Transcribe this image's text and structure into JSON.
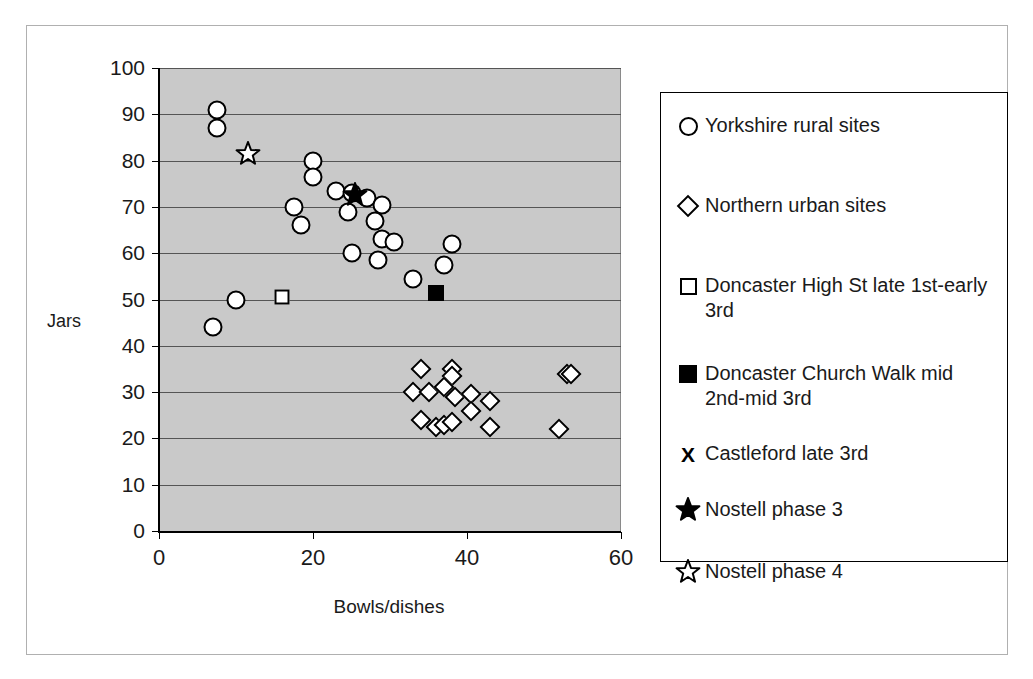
{
  "chart_data": {
    "type": "scatter",
    "title": "",
    "xlabel": "Bowls/dishes",
    "ylabel": "Jars",
    "xlim": [
      0,
      60
    ],
    "ylim": [
      0,
      100
    ],
    "xticks": [
      0,
      20,
      40,
      60
    ],
    "yticks": [
      0,
      10,
      20,
      30,
      40,
      50,
      60,
      70,
      80,
      90,
      100
    ],
    "grid": "horizontal",
    "plot_background": "#c9c9c9",
    "legend_position": "right",
    "series": [
      {
        "name": "Yorkshire rural sites",
        "marker": "open-circle",
        "points": [
          [
            7.5,
            91
          ],
          [
            7.5,
            87
          ],
          [
            20,
            80
          ],
          [
            20,
            76.5
          ],
          [
            17.5,
            70
          ],
          [
            18.5,
            66
          ],
          [
            23,
            73.5
          ],
          [
            25,
            73
          ],
          [
            27,
            72
          ],
          [
            24.5,
            69
          ],
          [
            29,
            70.5
          ],
          [
            28,
            67
          ],
          [
            29,
            63
          ],
          [
            30.5,
            62.5
          ],
          [
            25,
            60
          ],
          [
            28.5,
            58.5
          ],
          [
            33,
            54.5
          ],
          [
            37,
            57.5
          ],
          [
            38,
            62
          ],
          [
            10,
            50
          ],
          [
            7,
            44
          ]
        ]
      },
      {
        "name": "Northern urban sites",
        "marker": "open-diamond",
        "points": [
          [
            34,
            35
          ],
          [
            38,
            35
          ],
          [
            38,
            33.5
          ],
          [
            33,
            30
          ],
          [
            35,
            30
          ],
          [
            37,
            31
          ],
          [
            38.5,
            29
          ],
          [
            40.5,
            29.5
          ],
          [
            40.5,
            26
          ],
          [
            34,
            24
          ],
          [
            36,
            22.5
          ],
          [
            37,
            23
          ],
          [
            38,
            23.5
          ],
          [
            43,
            28
          ],
          [
            43,
            22.5
          ],
          [
            53,
            34
          ],
          [
            53.5,
            34
          ],
          [
            52,
            22
          ]
        ]
      },
      {
        "name": "Doncaster High St late 1st-early 3rd",
        "marker": "open-square",
        "points": [
          [
            16,
            50.5
          ]
        ]
      },
      {
        "name": "Doncaster Church Walk mid 2nd-mid 3rd",
        "marker": "filled-square",
        "points": [
          [
            36,
            51.5
          ]
        ]
      },
      {
        "name": "Castleford late 3rd",
        "marker": "x",
        "points": []
      },
      {
        "name": "Nostell phase 3",
        "marker": "filled-star",
        "points": [
          [
            25.5,
            72.5
          ]
        ]
      },
      {
        "name": "Nostell phase 4",
        "marker": "open-star",
        "points": [
          [
            11.5,
            81.5
          ]
        ]
      }
    ]
  },
  "legend": {
    "entries": [
      {
        "key": "open-circle",
        "label": "Yorkshire rural sites"
      },
      {
        "key": "open-diamond",
        "label": "Northern urban sites"
      },
      {
        "key": "open-square",
        "label": "Doncaster High St late 1st-early 3rd"
      },
      {
        "key": "filled-square",
        "label": "Doncaster Church Walk mid 2nd-mid 3rd"
      },
      {
        "key": "x-mark",
        "label": "Castleford late 3rd"
      },
      {
        "key": "filled-star",
        "label": "Nostell phase 3"
      },
      {
        "key": "open-star",
        "label": "Nostell phase 4"
      }
    ],
    "x_glyph": "X"
  },
  "colors": {
    "plot_background": "#c9c9c9",
    "gridline": "#555555",
    "axis": "#000000",
    "marker_outline": "#000000",
    "marker_fill": "#ffffff",
    "frame": "#b0b0b0"
  }
}
